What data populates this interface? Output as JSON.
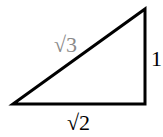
{
  "diagram": {
    "type": "right-triangle",
    "vertices": {
      "bottom_left": [
        13,
        104
      ],
      "bottom_right": [
        145,
        104
      ],
      "top_right": [
        145,
        9
      ]
    },
    "stroke_color": "#000000",
    "labels": {
      "hypotenuse": {
        "text": "√3",
        "color": "#8a8a8a"
      },
      "vertical_leg": {
        "text": "1",
        "color": "#000000"
      },
      "horizontal_leg": {
        "text": "√2",
        "color": "#000000"
      }
    }
  }
}
